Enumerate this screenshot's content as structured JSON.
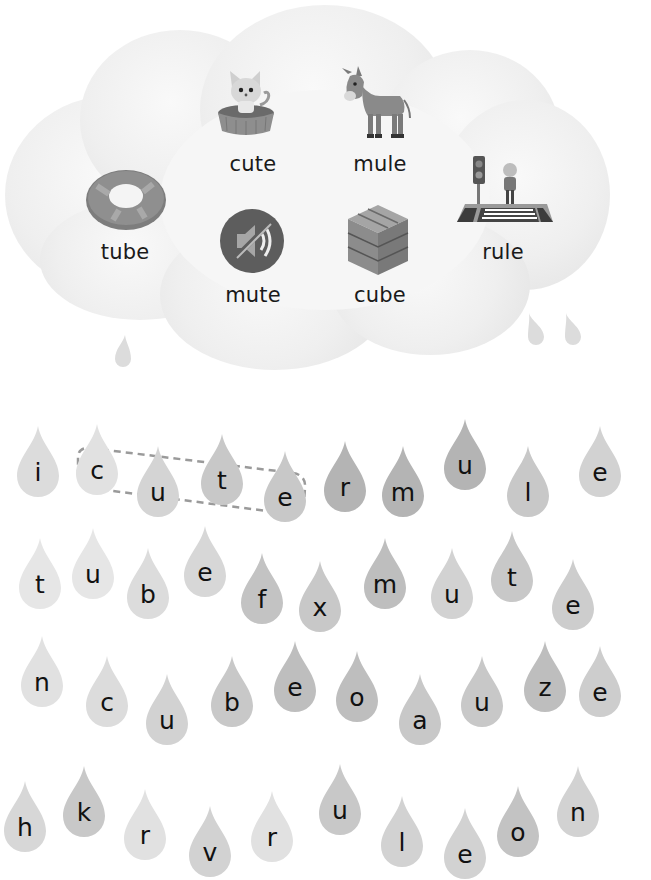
{
  "cloud": {
    "words": [
      {
        "id": "cute",
        "label": "cute",
        "x": 253,
        "y": 152,
        "icon": "kitten-in-basket-icon"
      },
      {
        "id": "mule",
        "label": "mule",
        "x": 380,
        "y": 152,
        "icon": "donkey-icon"
      },
      {
        "id": "tube",
        "label": "tube",
        "x": 125,
        "y": 240,
        "icon": "swim-ring-icon"
      },
      {
        "id": "rule",
        "label": "rule",
        "x": 503,
        "y": 240,
        "icon": "crosswalk-traffic-light-icon"
      },
      {
        "id": "mute",
        "label": "mute",
        "x": 253,
        "y": 283,
        "icon": "mute-speaker-icon"
      },
      {
        "id": "cube",
        "label": "cube",
        "x": 380,
        "y": 283,
        "icon": "cube-box-icon"
      }
    ]
  },
  "puzzle": {
    "highlighted_word": "cute",
    "rows": [
      [
        {
          "l": "i",
          "x": 38,
          "y": 470,
          "s": 0.88
        },
        {
          "l": "c",
          "x": 97,
          "y": 468,
          "s": 0.9
        },
        {
          "l": "u",
          "x": 158,
          "y": 490,
          "s": 0.85
        },
        {
          "l": "t",
          "x": 222,
          "y": 478,
          "s": 0.8
        },
        {
          "l": "e",
          "x": 285,
          "y": 495,
          "s": 0.8
        },
        {
          "l": "r",
          "x": 345,
          "y": 485,
          "s": 0.72
        },
        {
          "l": "m",
          "x": 403,
          "y": 490,
          "s": 0.72
        },
        {
          "l": "u",
          "x": 465,
          "y": 463,
          "s": 0.72
        },
        {
          "l": "l",
          "x": 528,
          "y": 490,
          "s": 0.8
        },
        {
          "l": "e",
          "x": 600,
          "y": 470,
          "s": 0.84
        }
      ],
      [
        {
          "l": "t",
          "x": 40,
          "y": 582,
          "s": 0.92
        },
        {
          "l": "u",
          "x": 93,
          "y": 572,
          "s": 0.92
        },
        {
          "l": "b",
          "x": 148,
          "y": 592,
          "s": 0.88
        },
        {
          "l": "e",
          "x": 205,
          "y": 570,
          "s": 0.86
        },
        {
          "l": "f",
          "x": 262,
          "y": 597,
          "s": 0.78
        },
        {
          "l": "x",
          "x": 320,
          "y": 605,
          "s": 0.8
        },
        {
          "l": "m",
          "x": 385,
          "y": 582,
          "s": 0.76
        },
        {
          "l": "u",
          "x": 452,
          "y": 592,
          "s": 0.84
        },
        {
          "l": "t",
          "x": 512,
          "y": 575,
          "s": 0.8
        },
        {
          "l": "e",
          "x": 573,
          "y": 603,
          "s": 0.82
        }
      ],
      [
        {
          "l": "n",
          "x": 42,
          "y": 680,
          "s": 0.9
        },
        {
          "l": "c",
          "x": 107,
          "y": 700,
          "s": 0.88
        },
        {
          "l": "u",
          "x": 167,
          "y": 718,
          "s": 0.84
        },
        {
          "l": "b",
          "x": 232,
          "y": 700,
          "s": 0.8
        },
        {
          "l": "e",
          "x": 295,
          "y": 685,
          "s": 0.76
        },
        {
          "l": "o",
          "x": 357,
          "y": 695,
          "s": 0.76
        },
        {
          "l": "a",
          "x": 420,
          "y": 718,
          "s": 0.8
        },
        {
          "l": "u",
          "x": 482,
          "y": 700,
          "s": 0.8
        },
        {
          "l": "z",
          "x": 545,
          "y": 685,
          "s": 0.76
        },
        {
          "l": "e",
          "x": 600,
          "y": 690,
          "s": 0.82
        }
      ],
      [
        {
          "l": "h",
          "x": 25,
          "y": 825,
          "s": 0.86
        },
        {
          "l": "k",
          "x": 84,
          "y": 810,
          "s": 0.8
        },
        {
          "l": "r",
          "x": 145,
          "y": 833,
          "s": 0.9
        },
        {
          "l": "v",
          "x": 210,
          "y": 850,
          "s": 0.84
        },
        {
          "l": "r",
          "x": 272,
          "y": 835,
          "s": 0.9
        },
        {
          "l": "u",
          "x": 340,
          "y": 808,
          "s": 0.8
        },
        {
          "l": "l",
          "x": 402,
          "y": 840,
          "s": 0.84
        },
        {
          "l": "e",
          "x": 465,
          "y": 852,
          "s": 0.84
        },
        {
          "l": "o",
          "x": 518,
          "y": 830,
          "s": 0.78
        },
        {
          "l": "n",
          "x": 578,
          "y": 810,
          "s": 0.84
        }
      ]
    ]
  },
  "colors": {
    "text": "#111111",
    "drop_fill": "#c8c8c8",
    "cloud": "#eeeeee",
    "dash": "#9a9a9a"
  }
}
